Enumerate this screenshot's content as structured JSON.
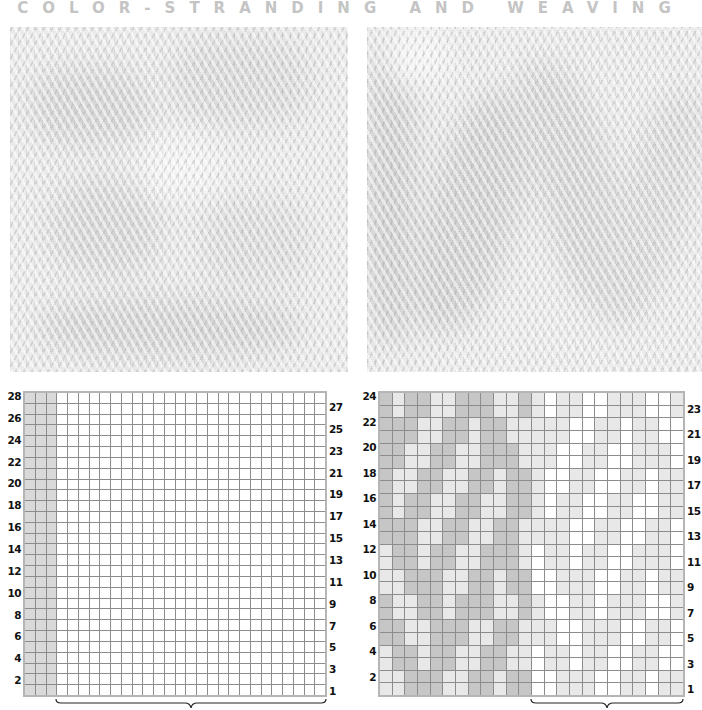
{
  "title": "COLOR-STRANDING AND WEAVING",
  "photos": [
    {
      "name": "left-swatch-photo",
      "description": "knitted swatch, pale gray on white"
    },
    {
      "name": "right-swatch-photo",
      "description": "knitted swatch, diagonal zigzag pattern"
    }
  ],
  "colors": {
    "dark_gray": "#c6c6c6",
    "light_gray": "#e8e8e8",
    "edge_gray": "#d9d9d9",
    "white": "#ffffff",
    "grid_line": "#8c8c8c",
    "title": "#c4c4c4"
  },
  "left_chart": {
    "columns": 28,
    "rows": 28,
    "gray_columns": [
      1,
      2,
      3
    ],
    "left_row_labels": [
      "28",
      "26",
      "24",
      "22",
      "20",
      "18",
      "16",
      "14",
      "12",
      "10",
      "8",
      "6",
      "4",
      "2"
    ],
    "right_row_labels": [
      "27",
      "25",
      "23",
      "21",
      "19",
      "17",
      "15",
      "13",
      "11",
      "9",
      "7",
      "5",
      "3",
      "1"
    ],
    "bracket": {
      "from_col": 4,
      "to_col": 28
    }
  },
  "right_chart": {
    "columns": 24,
    "rows": 24,
    "left_row_labels": [
      "24",
      "22",
      "20",
      "18",
      "16",
      "14",
      "12",
      "10",
      "8",
      "6",
      "4",
      "2"
    ],
    "right_row_labels": [
      "23",
      "21",
      "19",
      "17",
      "15",
      "13",
      "11",
      "9",
      "7",
      "5",
      "3",
      "1"
    ],
    "bracket": {
      "from_col": 13,
      "to_col": 24
    },
    "legend": {
      "D": "dark gray (left half)",
      "L": "light (left half)",
      "right_half": "D->light gray, L->white"
    },
    "rows_top_to_bottom": [
      "DLDDLLDDDLLD",
      "DLDDLLDDDLLD",
      "DDDLLDDLDDLL",
      "DDDLLDDLDDLL",
      "DDLLDDLLDDDL",
      "DDLLDDLLDDDL",
      "DLLDDLLDDLDD",
      "DLLDDLLDDLDD",
      "DLDDLLDDLLDD",
      "DLDDLLDDLLDD",
      "DDDLLDDLLDDL",
      "DDDLLDDLLDDL",
      "LDDLDDLLDDDL",
      "LDDLDDLLDDDL",
      "LLDDDLLDDLDD",
      "LLDDDLLDDLDD",
      "DLLDDLDDDLLD",
      "DLLDDLDDDLLD",
      "DDLLDDDLLDDL",
      "DDLLDDDLLDDL",
      "LDDLDDLLDDLL",
      "LDDLDDLLDDLL",
      "LLDDDLLDDLDD",
      "LLDDDLLDDLDD"
    ]
  }
}
